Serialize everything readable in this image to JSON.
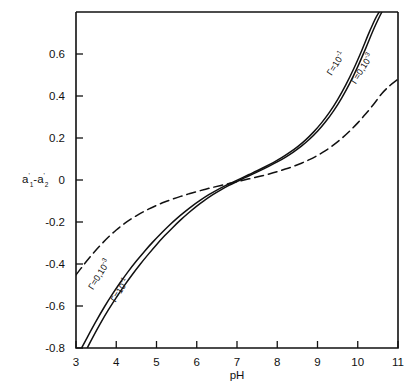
{
  "figure": {
    "background_color": "#ffffff",
    "axis_color": "#111111",
    "curve_color": "#111111"
  },
  "chart_data": {
    "type": "line",
    "title": "",
    "xlabel": "pH",
    "ylabel": "a'1-a'2",
    "ylabel_parts": {
      "a": "a",
      "prime": "'",
      "sub1": "1",
      "minus": "-",
      "sub2": "2"
    },
    "xlim": [
      3,
      11
    ],
    "ylim": [
      -0.8,
      0.8
    ],
    "xticks": [
      3,
      4,
      5,
      6,
      7,
      8,
      9,
      10,
      11
    ],
    "xtick_labels": [
      "3",
      "4",
      "5",
      "6",
      "7",
      "8",
      "9",
      "10",
      "11"
    ],
    "yticks": [
      0.6,
      0.4,
      0.2,
      0,
      -0.2,
      -0.4,
      -0.6,
      -0.8
    ],
    "ytick_labels": [
      "0.6",
      "0.4",
      "0.2",
      "0",
      "-0.2",
      "-0.4",
      "-0.6",
      "-0.8"
    ],
    "grid": false,
    "legend_position": "inline-annotations",
    "series": [
      {
        "name": "gamma-1e-1-solid",
        "label": "Γ=10⁻¹",
        "label_text_base": "Γ=10",
        "label_text_exponent": "-1",
        "style": "solid",
        "x": [
          3.28,
          3.4,
          3.6,
          3.8,
          4.0,
          4.2,
          4.4,
          4.6,
          4.8,
          5.0,
          5.2,
          5.4,
          5.6,
          5.8,
          6.0,
          6.2,
          6.4,
          6.6,
          6.8,
          7.0,
          7.2,
          7.4,
          7.6,
          7.8,
          8.0,
          8.2,
          8.4,
          8.6,
          8.8,
          9.0,
          9.2,
          9.4,
          9.6,
          9.8,
          10.0,
          10.2,
          10.4,
          10.6,
          10.75
        ],
        "y": [
          -0.8,
          -0.755,
          -0.685,
          -0.62,
          -0.56,
          -0.503,
          -0.45,
          -0.4,
          -0.353,
          -0.308,
          -0.266,
          -0.227,
          -0.19,
          -0.156,
          -0.124,
          -0.096,
          -0.07,
          -0.047,
          -0.026,
          -0.007,
          0.011,
          0.029,
          0.047,
          0.066,
          0.086,
          0.108,
          0.133,
          0.161,
          0.194,
          0.232,
          0.277,
          0.329,
          0.39,
          0.46,
          0.54,
          0.628,
          0.72,
          0.8,
          0.845
        ]
      },
      {
        "name": "gamma-0-1e-3-solid",
        "label": "Γ=0,10⁻³",
        "label_text_base": "Γ=0,10",
        "label_text_exponent": "-3",
        "style": "solid",
        "x": [
          3.14,
          3.3,
          3.5,
          3.7,
          3.9,
          4.1,
          4.3,
          4.5,
          4.7,
          4.9,
          5.1,
          5.3,
          5.5,
          5.7,
          5.9,
          6.1,
          6.3,
          6.5,
          6.7,
          6.9,
          7.1,
          7.3,
          7.5,
          7.7,
          7.9,
          8.1,
          8.3,
          8.5,
          8.7,
          8.9,
          9.1,
          9.3,
          9.5,
          9.7,
          9.9,
          10.1,
          10.3,
          10.5,
          10.7,
          10.95
        ],
        "y": [
          -0.8,
          -0.742,
          -0.672,
          -0.606,
          -0.545,
          -0.488,
          -0.435,
          -0.386,
          -0.34,
          -0.297,
          -0.257,
          -0.219,
          -0.184,
          -0.152,
          -0.122,
          -0.095,
          -0.07,
          -0.048,
          -0.028,
          -0.01,
          0.008,
          0.026,
          0.044,
          0.063,
          0.083,
          0.105,
          0.13,
          0.158,
          0.19,
          0.228,
          0.272,
          0.323,
          0.383,
          0.452,
          0.53,
          0.617,
          0.71,
          0.79,
          0.83,
          0.848
        ]
      },
      {
        "name": "gamma-dashed",
        "label": "",
        "style": "dashed",
        "x": [
          3.0,
          3.2,
          3.4,
          3.6,
          3.8,
          4.0,
          4.2,
          4.4,
          4.6,
          4.8,
          5.0,
          5.2,
          5.4,
          5.6,
          5.8,
          6.0,
          6.2,
          6.4,
          6.6,
          6.8,
          7.0,
          7.2,
          7.4,
          7.6,
          7.8,
          8.0,
          8.2,
          8.4,
          8.6,
          8.8,
          9.0,
          9.2,
          9.4,
          9.6,
          9.8,
          10.0,
          10.2,
          10.4,
          10.6,
          10.8,
          11.0
        ],
        "y": [
          -0.452,
          -0.402,
          -0.355,
          -0.312,
          -0.273,
          -0.238,
          -0.208,
          -0.182,
          -0.159,
          -0.139,
          -0.121,
          -0.105,
          -0.091,
          -0.078,
          -0.066,
          -0.055,
          -0.045,
          -0.035,
          -0.026,
          -0.017,
          -0.008,
          0.001,
          0.01,
          0.019,
          0.029,
          0.04,
          0.052,
          0.065,
          0.08,
          0.097,
          0.117,
          0.14,
          0.167,
          0.198,
          0.233,
          0.272,
          0.315,
          0.362,
          0.412,
          0.45,
          0.48
        ]
      }
    ],
    "annotations": [
      {
        "id": "ann-top-inner",
        "base": "Γ=10",
        "exponent": "-1",
        "x": 9.35,
        "y": 0.495,
        "rotation": -58
      },
      {
        "id": "ann-top-outer",
        "base": "Γ=0,10",
        "exponent": "-3",
        "x": 9.95,
        "y": 0.455,
        "rotation": -58
      },
      {
        "id": "ann-bot-upper",
        "base": "Γ=0,10",
        "exponent": "-3",
        "x": 3.42,
        "y": -0.525,
        "rotation": -58
      },
      {
        "id": "ann-bot-lower",
        "base": "Γ=10",
        "exponent": "-1",
        "x": 3.98,
        "y": -0.585,
        "rotation": -58
      }
    ]
  }
}
